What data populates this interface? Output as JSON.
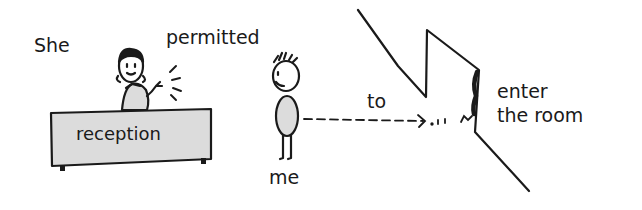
{
  "labels": {
    "subject": "She",
    "verb": "permitted",
    "desk": "reception",
    "object": "me",
    "particle": "to",
    "action_line1": "enter",
    "action_line2": "the room"
  },
  "colors": {
    "ink": "#1a1a1a",
    "fill_gray": "#dcdcdc",
    "background": "#ffffff"
  }
}
